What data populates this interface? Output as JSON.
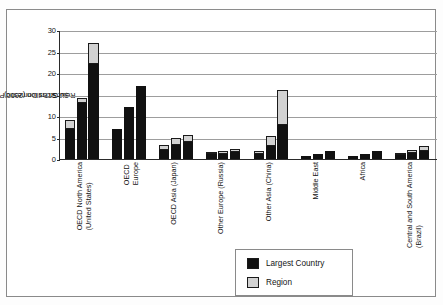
{
  "chart_data": {
    "type": "bar",
    "title": "",
    "subtitle": "",
    "xlabel": "",
    "ylabel": "Real Gross Domestic Product $U.S. Trillion (2000)",
    "ylabel_line1": "Real Gross Domestic Product",
    "ylabel_line2": "$U.S. Trillion (2000)",
    "ylim": [
      0,
      30
    ],
    "yticks": [
      0,
      5,
      10,
      15,
      20,
      25,
      30
    ],
    "grid": true,
    "legend_position": "inside-bottom-center",
    "stacked": true,
    "bars_per_category": 3,
    "series": [
      {
        "name": "Largest Country",
        "color": "#111111",
        "values": [
          [
            7.0,
            13.0,
            22.0
          ],
          [
            7.0,
            12.0,
            17.0
          ],
          [
            2.2,
            3.2,
            4.0
          ],
          [
            1.2,
            1.2,
            1.6
          ],
          [
            1.2,
            3.0,
            8.0
          ],
          [
            0.8,
            1.1,
            1.8
          ],
          [
            0.8,
            1.1,
            1.9
          ],
          [
            1.0,
            1.3,
            1.8
          ]
        ]
      },
      {
        "name": "Region",
        "color": "#d2d2d2",
        "values": [
          [
            2.0,
            1.2,
            5.0
          ],
          [
            0.0,
            0.0,
            0.0
          ],
          [
            1.0,
            1.6,
            1.6
          ],
          [
            0.5,
            0.6,
            0.8
          ],
          [
            0.6,
            2.3,
            8.0
          ],
          [
            0.0,
            0.0,
            0.0
          ],
          [
            0.0,
            0.0,
            0.0
          ],
          [
            0.4,
            0.9,
            1.2
          ]
        ]
      }
    ],
    "totals": [
      [
        9.0,
        14.2,
        27.0
      ],
      [
        7.0,
        12.0,
        17.0
      ],
      [
        3.2,
        4.8,
        5.6
      ],
      [
        1.7,
        1.8,
        2.4
      ],
      [
        1.8,
        5.3,
        16.0
      ],
      [
        0.8,
        1.1,
        1.8
      ],
      [
        0.8,
        1.1,
        1.9
      ],
      [
        1.4,
        2.2,
        3.0
      ]
    ],
    "categories": [
      {
        "line1": "OECD North America",
        "line2": "(United States)"
      },
      {
        "line1": "OECD",
        "line2": "Europe"
      },
      {
        "line1": "OECD Asia (Japan)",
        "line2": ""
      },
      {
        "line1": "Other Europe (Russia)",
        "line2": ""
      },
      {
        "line1": "Other Asia (China)",
        "line2": ""
      },
      {
        "line1": "Middle East",
        "line2": ""
      },
      {
        "line1": "Africa",
        "line2": ""
      },
      {
        "line1": "Central and South America",
        "line2": "(Brazil)"
      }
    ],
    "legend": [
      {
        "label": "Largest Country",
        "color": "#111111"
      },
      {
        "label": "Region",
        "color": "#d2d2d2"
      }
    ]
  }
}
